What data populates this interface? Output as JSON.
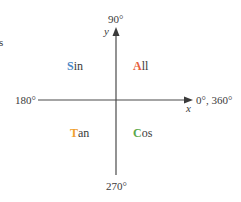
{
  "fragment": {
    "text": "s"
  },
  "axes": {
    "x_label": "x",
    "y_label": "y",
    "angle_top": "90°",
    "angle_left": "180°",
    "angle_right": "0°, 360°",
    "angle_bottom": "270°"
  },
  "quadrants": [
    {
      "id": "q2",
      "first": "S",
      "rest": "in",
      "color": "#4a86c5"
    },
    {
      "id": "q1",
      "first": "A",
      "rest": "ll",
      "color": "#e8603c"
    },
    {
      "id": "q3",
      "first": "T",
      "rest": "an",
      "color": "#f0a030"
    },
    {
      "id": "q4",
      "first": "C",
      "rest": "os",
      "color": "#5aa84a"
    }
  ],
  "colors": {
    "axis": "#4a4a4a",
    "text": "#3a3a3a"
  }
}
